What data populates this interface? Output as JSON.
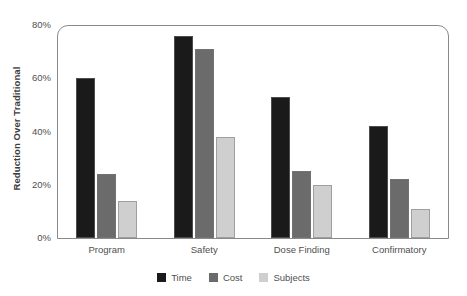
{
  "chart_data": {
    "type": "bar",
    "title": "",
    "xlabel": "",
    "ylabel": "Reduction Over Traditional",
    "categories": [
      "Program",
      "Safety",
      "Dose Finding",
      "Confirmatory"
    ],
    "series": [
      {
        "name": "Time",
        "color": "#1a1a1a",
        "values": [
          60,
          76,
          53,
          42
        ]
      },
      {
        "name": "Cost",
        "color": "#6b6b6b",
        "values": [
          24,
          71,
          25,
          22
        ]
      },
      {
        "name": "Subjects",
        "color": "#cfcfcf",
        "values": [
          14,
          38,
          20,
          11
        ]
      }
    ],
    "ylim": [
      0,
      80
    ],
    "yticks": [
      0,
      20,
      40,
      60,
      80
    ],
    "ytick_labels": [
      "0%",
      "20%",
      "40%",
      "60%",
      "80%"
    ],
    "grid": false,
    "legend_position": "bottom",
    "frame_color": "#8a8a8a",
    "background": "#ffffff"
  }
}
